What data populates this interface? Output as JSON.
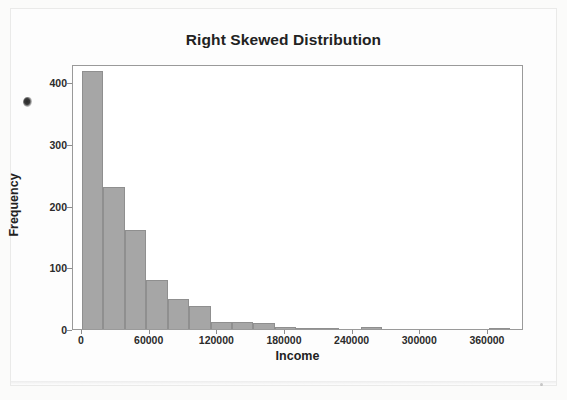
{
  "chart_data": {
    "type": "bar",
    "title": "Right Skewed Distribution",
    "xlabel": "Income",
    "ylabel": "Frequency",
    "xlim": [
      -8000,
      392000
    ],
    "ylim": [
      0,
      430
    ],
    "grid": false,
    "legend": null,
    "bin_width": 19000,
    "bar_color": "#a6a6a6",
    "bar_edge_color": "#8f8f8f",
    "x_ticks": [
      0,
      60000,
      120000,
      180000,
      240000,
      300000,
      360000
    ],
    "x_tick_labels": [
      "0",
      "60000",
      "120000",
      "180000",
      "240000",
      "300000",
      "360000"
    ],
    "y_ticks": [
      0,
      100,
      200,
      300,
      400
    ],
    "y_tick_labels": [
      "0",
      "100",
      "200",
      "300",
      "400"
    ],
    "bin_starts": [
      0,
      19000,
      38000,
      57000,
      76000,
      95000,
      114000,
      133000,
      152000,
      171000,
      190000,
      209000,
      228000,
      247000,
      266000,
      285000,
      304000,
      323000,
      342000,
      361000
    ],
    "categories": [
      "0",
      "19000",
      "38000",
      "57000",
      "76000",
      "95000",
      "114000",
      "133000",
      "152000",
      "171000",
      "190000",
      "209000",
      "228000",
      "247000",
      "266000",
      "285000",
      "304000",
      "323000",
      "342000",
      "361000"
    ],
    "values": [
      418,
      231,
      160,
      80,
      48,
      37,
      12,
      12,
      10,
      3,
      2,
      1,
      0,
      4,
      0,
      0,
      0,
      0,
      0,
      1
    ]
  },
  "figure": {
    "background_color": "#ffffff",
    "frame_color": "#9a9a9a",
    "title_color": "#222222"
  },
  "artifacts": {
    "ink_smudge": "scan-smudge"
  }
}
